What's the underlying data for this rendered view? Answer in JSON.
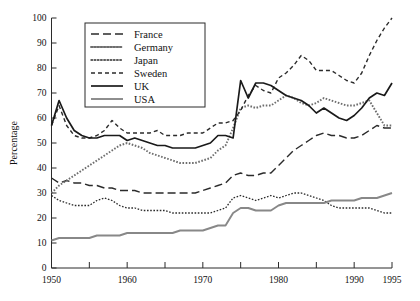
{
  "chart_data": {
    "type": "line",
    "title": "",
    "subtitle": "",
    "xlabel": "",
    "ylabel": "Percentage",
    "xlim": [
      1950,
      1995
    ],
    "ylim": [
      0,
      100
    ],
    "grid": false,
    "legend_position": "top-center",
    "y_ticks": [
      0,
      10,
      20,
      30,
      40,
      50,
      60,
      70,
      80,
      90,
      100
    ],
    "y_tick_labels": [
      "0",
      "10",
      "20",
      "30",
      "40",
      "50",
      "60",
      "70",
      "80",
      "90",
      "100"
    ],
    "x_ticks": [
      1950,
      1955,
      1960,
      1965,
      1970,
      1975,
      1980,
      1985,
      1990,
      1995
    ],
    "x_tick_labels": [
      "1950",
      "",
      "1960",
      "",
      "1970",
      "",
      "1980",
      "",
      "1990",
      "1995"
    ],
    "x": [
      1950,
      1951,
      1952,
      1953,
      1954,
      1955,
      1956,
      1957,
      1958,
      1959,
      1960,
      1961,
      1962,
      1963,
      1964,
      1965,
      1966,
      1967,
      1968,
      1969,
      1970,
      1971,
      1972,
      1973,
      1974,
      1975,
      1976,
      1977,
      1978,
      1979,
      1980,
      1981,
      1982,
      1983,
      1984,
      1985,
      1986,
      1987,
      1988,
      1989,
      1990,
      1991,
      1992,
      1993,
      1994,
      1995
    ],
    "series": [
      {
        "name": "France",
        "color": "#2b2b2b",
        "style": "long-dash",
        "dasharray": "8,4",
        "width": 1.4,
        "values": [
          36,
          34,
          35,
          34,
          34,
          33,
          33,
          32,
          32,
          31,
          31,
          31,
          30,
          30,
          30,
          30,
          30,
          30,
          30,
          30,
          31,
          32,
          33,
          34,
          37,
          38,
          37,
          37,
          38,
          38,
          41,
          44,
          47,
          49,
          51,
          53,
          54,
          53,
          53,
          52,
          52,
          53,
          55,
          57,
          56,
          56
        ]
      },
      {
        "name": "Germany",
        "color": "#6e6e6e",
        "style": "fine-dot",
        "dasharray": "1.6,1.6",
        "width": 1.9,
        "values": [
          30,
          33,
          35,
          37,
          39,
          41,
          43,
          45,
          47,
          49,
          50,
          49,
          48,
          46,
          45,
          44,
          43,
          42,
          42,
          42,
          43,
          44,
          47,
          49,
          56,
          64,
          65,
          64,
          65,
          65,
          67,
          69,
          68,
          66,
          65,
          66,
          68,
          67,
          66,
          65,
          65,
          66,
          67,
          62,
          57,
          57
        ]
      },
      {
        "name": "Japan",
        "color": "#2b2b2b",
        "style": "fine-dot",
        "dasharray": "1.6,1.6",
        "width": 1.3,
        "values": [
          29,
          27,
          26,
          25,
          25,
          25,
          27,
          28,
          27,
          25,
          24,
          24,
          23,
          23,
          23,
          23,
          22,
          22,
          22,
          22,
          22,
          22,
          23,
          24,
          28,
          29,
          28,
          27,
          28,
          29,
          28,
          29,
          30,
          30,
          29,
          28,
          27,
          25,
          24,
          24,
          24,
          24,
          24,
          23,
          22,
          22
        ]
      },
      {
        "name": "Sweden",
        "color": "#2b2b2b",
        "style": "medium-dash",
        "dasharray": "4,3",
        "width": 1.4,
        "values": [
          57,
          65,
          57,
          53,
          52,
          52,
          53,
          55,
          59,
          56,
          54,
          54,
          54,
          54,
          55,
          53,
          53,
          53,
          54,
          54,
          54,
          56,
          58,
          58,
          59,
          63,
          69,
          73,
          71,
          70,
          76,
          78,
          81,
          85,
          83,
          79,
          79,
          79,
          77,
          75,
          74,
          78,
          85,
          91,
          96,
          100
        ]
      },
      {
        "name": "UK",
        "color": "#1a1a1a",
        "style": "solid",
        "dasharray": "0",
        "width": 1.7,
        "values": [
          57,
          67,
          60,
          55,
          53,
          52,
          52,
          53,
          53,
          53,
          51,
          52,
          51,
          50,
          49,
          49,
          48,
          48,
          48,
          48,
          49,
          50,
          53,
          53,
          52,
          75,
          68,
          74,
          74,
          73,
          71,
          69,
          68,
          67,
          65,
          62,
          64,
          62,
          60,
          59,
          61,
          64,
          68,
          70,
          69,
          74
        ]
      },
      {
        "name": "USA",
        "color": "#888888",
        "style": "solid",
        "dasharray": "0",
        "width": 1.9,
        "values": [
          11,
          12,
          12,
          12,
          12,
          12,
          13,
          13,
          13,
          13,
          14,
          14,
          14,
          14,
          14,
          14,
          14,
          15,
          15,
          15,
          15,
          16,
          17,
          17,
          22,
          24,
          24,
          23,
          23,
          23,
          25,
          26,
          26,
          26,
          26,
          26,
          26,
          27,
          27,
          27,
          27,
          28,
          28,
          28,
          29,
          30
        ]
      }
    ]
  },
  "legend": {
    "entries": [
      {
        "label": "France"
      },
      {
        "label": "Germany"
      },
      {
        "label": "Japan"
      },
      {
        "label": "Sweden"
      },
      {
        "label": "UK"
      },
      {
        "label": "USA"
      }
    ]
  }
}
